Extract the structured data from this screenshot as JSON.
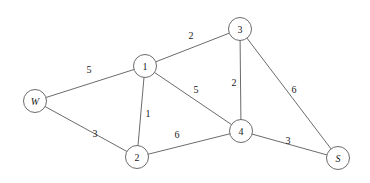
{
  "diagram": {
    "type": "weighted-undirected-graph",
    "title": "",
    "canvas": {
      "width": 370,
      "height": 183,
      "background": "#ffffff"
    },
    "style": {
      "stroke_color": "#5a5a5a",
      "node_fill": "#ffffff",
      "text_color": "#1a1a1a",
      "node_radius": 11.5
    },
    "nodes": [
      {
        "id": "W",
        "label": "W",
        "x": 35,
        "y": 101,
        "italic": true
      },
      {
        "id": "1",
        "label": "1",
        "x": 145,
        "y": 66,
        "italic": false
      },
      {
        "id": "2",
        "label": "2",
        "x": 137,
        "y": 157,
        "italic": false
      },
      {
        "id": "3",
        "label": "3",
        "x": 240,
        "y": 29,
        "italic": false
      },
      {
        "id": "4",
        "label": "4",
        "x": 241,
        "y": 131,
        "italic": false
      },
      {
        "id": "S",
        "label": "S",
        "x": 338,
        "y": 158,
        "italic": true
      }
    ],
    "edges": [
      {
        "from": "W",
        "to": "1",
        "weight": "5",
        "label_x": 89,
        "label_y": 69
      },
      {
        "from": "W",
        "to": "2",
        "weight": "3",
        "label_x": 95,
        "label_y": 133
      },
      {
        "from": "1",
        "to": "3",
        "weight": "2",
        "label_x": 191,
        "label_y": 35
      },
      {
        "from": "1",
        "to": "2",
        "weight": "1",
        "label_x": 148,
        "label_y": 113
      },
      {
        "from": "1",
        "to": "4",
        "weight": "5",
        "label_x": 196,
        "label_y": 89
      },
      {
        "from": "3",
        "to": "4",
        "weight": "2",
        "label_x": 234,
        "label_y": 82
      },
      {
        "from": "3",
        "to": "S",
        "weight": "6",
        "label_x": 294,
        "label_y": 89
      },
      {
        "from": "2",
        "to": "4",
        "weight": "6",
        "label_x": 177,
        "label_y": 134
      },
      {
        "from": "4",
        "to": "S",
        "weight": "3",
        "label_x": 288,
        "label_y": 140
      }
    ]
  }
}
